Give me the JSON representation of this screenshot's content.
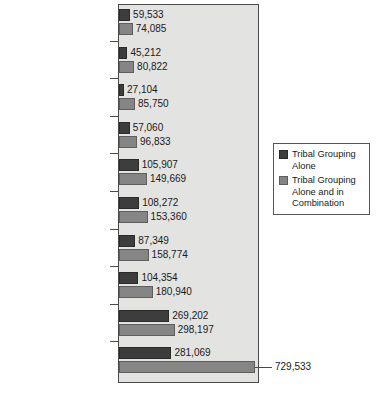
{
  "chart_data": {
    "type": "bar",
    "orientation": "horizontal",
    "title": "",
    "xlabel": "",
    "ylabel": "",
    "grid": false,
    "legend_position": "right",
    "xlim": [
      0,
      745000
    ],
    "categories": [
      "Pueblo",
      "Iroguois",
      "Blackfeet",
      "Apache",
      "Chippewa",
      "Sioux",
      "Choctaw",
      "Latin American Indian",
      "Navajo",
      "Cherokee"
    ],
    "series": [
      {
        "name": "Tribal Grouping Alone",
        "color": "#3d3d3d",
        "values": [
          59533,
          45212,
          27104,
          57060,
          105907,
          108272,
          87349,
          104354,
          269202,
          281069
        ],
        "labels": [
          "59,533",
          "45,212",
          "27,104",
          "57,060",
          "105,907",
          "108,272",
          "87,349",
          "104,354",
          "269,202",
          "281,069"
        ]
      },
      {
        "name": "Tribal Grouping Alone and in Combination",
        "color": "#858585",
        "values": [
          74085,
          80822,
          85750,
          96833,
          149669,
          153360,
          158774,
          180940,
          298197,
          729533
        ],
        "labels": [
          "74,085",
          "80,822",
          "85,750",
          "96,833",
          "149,669",
          "153,360",
          "158,774",
          "180,940",
          "298,197",
          "729,533"
        ]
      }
    ]
  },
  "legend": {
    "items": [
      {
        "label": "Tribal Grouping Alone",
        "swatch": "dark-gray-swatch"
      },
      {
        "label": "Tribal Grouping Alone and in Combination",
        "swatch": "medium-gray-swatch"
      }
    ]
  },
  "colors": {
    "series_alone": "#3d3d3d",
    "series_combination": "#858585",
    "plot_background": "#e3e3e1",
    "frame": "#4a4a4a",
    "page_background": "#ffffff"
  }
}
